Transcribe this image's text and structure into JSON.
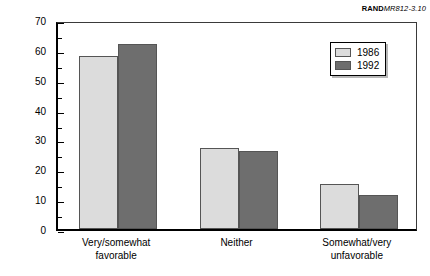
{
  "credit": {
    "brand": "RAND",
    "doc_id": "MR812-3.10"
  },
  "chart_data": {
    "type": "bar",
    "title": "",
    "xlabel": "",
    "ylabel": "Percentage",
    "ylim": [
      0,
      70
    ],
    "ytick_step": 10,
    "yminor_step": 5,
    "ytick_labels": [
      "70",
      "60",
      "50",
      "40",
      "30",
      "20",
      "10",
      "0"
    ],
    "grid": false,
    "legend_position": "top-right",
    "categories": [
      "Very/somewhat\nfavorable",
      "Neither",
      "Somewhat/very\nunfavorable"
    ],
    "series": [
      {
        "name": "1986",
        "color": "#dcdcdc",
        "values": [
          58,
          27,
          15
        ]
      },
      {
        "name": "1992",
        "color": "#6e6e6e",
        "values": [
          62,
          26,
          11.5
        ]
      }
    ]
  }
}
